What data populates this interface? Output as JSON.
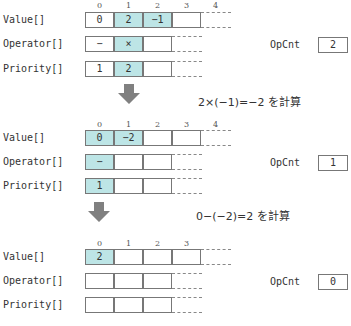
{
  "colors": {
    "highlight": "#bde5e6",
    "border": "#777777",
    "arrow": "#808080"
  },
  "labels": {
    "value": "Value[]",
    "operator": "Operator[]",
    "priority": "Priority[]",
    "opcnt": "OpCnt"
  },
  "steps": [
    {
      "indices": [
        "0",
        "1",
        "2",
        "3",
        "4"
      ],
      "value": [
        {
          "v": "0",
          "hl": false
        },
        {
          "v": "2",
          "hl": true
        },
        {
          "v": "−1",
          "hl": true
        },
        {
          "v": "",
          "hl": false
        }
      ],
      "operator": [
        {
          "v": "−",
          "hl": false
        },
        {
          "v": "×",
          "hl": true
        },
        {
          "v": "",
          "hl": false
        }
      ],
      "priority": [
        {
          "v": "1",
          "hl": false
        },
        {
          "v": "2",
          "hl": true
        },
        {
          "v": "",
          "hl": false
        }
      ],
      "opcnt": "2"
    },
    {
      "indices": [
        "0",
        "1",
        "2",
        "3",
        "4"
      ],
      "value": [
        {
          "v": "0",
          "hl": true
        },
        {
          "v": "−2",
          "hl": true
        },
        {
          "v": "",
          "hl": false
        },
        {
          "v": "",
          "hl": false
        }
      ],
      "operator": [
        {
          "v": "−",
          "hl": true
        },
        {
          "v": "",
          "hl": false
        },
        {
          "v": "",
          "hl": false
        }
      ],
      "priority": [
        {
          "v": "1",
          "hl": true
        },
        {
          "v": "",
          "hl": false
        },
        {
          "v": "",
          "hl": false
        }
      ],
      "opcnt": "1"
    },
    {
      "indices": [
        "0",
        "1",
        "2",
        "3"
      ],
      "value": [
        {
          "v": "2",
          "hl": true
        },
        {
          "v": "",
          "hl": false
        },
        {
          "v": "",
          "hl": false
        },
        {
          "v": "",
          "hl": false
        }
      ],
      "operator": [
        {
          "v": "",
          "hl": false
        },
        {
          "v": "",
          "hl": false
        },
        {
          "v": "",
          "hl": false
        }
      ],
      "priority": [
        {
          "v": "",
          "hl": false
        },
        {
          "v": "",
          "hl": false
        },
        {
          "v": "",
          "hl": false
        }
      ],
      "opcnt": "0"
    }
  ],
  "calculations": [
    "2×(−1)=−2 を計算",
    "0−(−2)=2 を計算"
  ]
}
